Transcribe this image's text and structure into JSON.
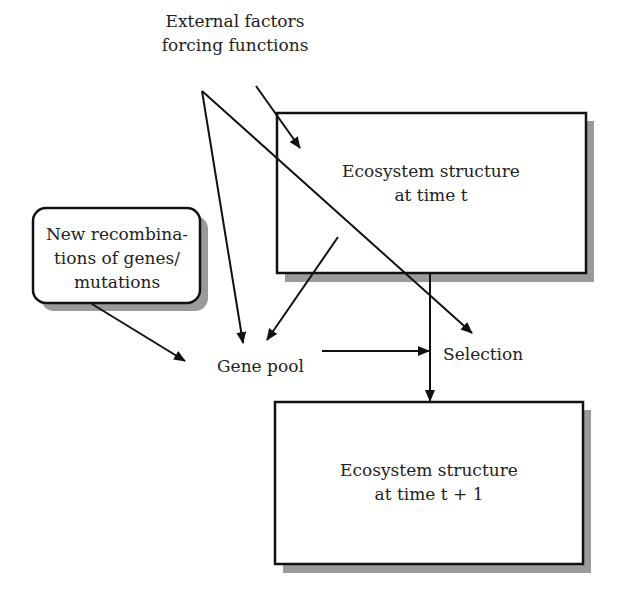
{
  "diagram": {
    "type": "flow",
    "nodes": {
      "external": {
        "id": "external",
        "lines": [
          "External factors",
          "forcing functions"
        ],
        "shape": "text"
      },
      "ecosystem_t": {
        "id": "ecosystem_t",
        "lines": [
          "Ecosystem structure",
          "at time t"
        ],
        "shape": "box-shadow"
      },
      "recombination": {
        "id": "recombination",
        "lines": [
          "New recombina-",
          "tions of genes/",
          "mutations"
        ],
        "shape": "rounded-box-shadow"
      },
      "gene_pool": {
        "id": "gene_pool",
        "label": "Gene pool",
        "shape": "text"
      },
      "selection": {
        "id": "selection",
        "label": "Selection",
        "shape": "text"
      },
      "ecosystem_t1": {
        "id": "ecosystem_t1",
        "lines": [
          "Ecosystem structure",
          "at time t + 1"
        ],
        "shape": "box-shadow"
      }
    },
    "edges": [
      {
        "from": "external",
        "to": "ecosystem_t"
      },
      {
        "from": "external",
        "to": "gene_pool"
      },
      {
        "from": "external",
        "to": "selection"
      },
      {
        "from": "ecosystem_t",
        "to": "gene_pool"
      },
      {
        "from": "recombination",
        "to": "gene_pool"
      },
      {
        "from": "gene_pool",
        "to": "selection"
      },
      {
        "from": "ecosystem_t",
        "to": "ecosystem_t1",
        "via": "selection"
      }
    ],
    "colors": {
      "line": "#111111",
      "shadow": "#9a9a9a",
      "background": "#ffffff",
      "text": "#222222"
    }
  }
}
